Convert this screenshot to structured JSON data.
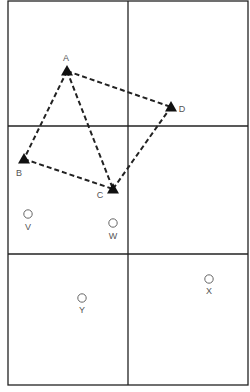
{
  "diagram": {
    "type": "grid-plot-map",
    "grid": {
      "left": 8,
      "top": 1,
      "right": 248,
      "bottom": 385,
      "vertical_dividers": [
        128
      ],
      "horizontal_dividers": [
        126,
        254
      ],
      "cells": 6,
      "line_color": "#222222"
    },
    "triangles": [
      {
        "id": "A",
        "label": "A",
        "x": 67,
        "y": 71,
        "label_x": 66,
        "label_y": 61
      },
      {
        "id": "B",
        "label": "B",
        "x": 24,
        "y": 159,
        "label_x": 19,
        "label_y": 176
      },
      {
        "id": "C",
        "label": "C",
        "x": 113,
        "y": 189,
        "label_x": 100,
        "label_y": 198
      },
      {
        "id": "D",
        "label": "D",
        "x": 171,
        "y": 107,
        "label_x": 182,
        "label_y": 112
      }
    ],
    "circles": [
      {
        "id": "V",
        "label": "V",
        "x": 28,
        "y": 214,
        "label_x": 28,
        "label_y": 230
      },
      {
        "id": "W",
        "label": "W",
        "x": 113,
        "y": 223,
        "label_x": 113,
        "label_y": 239
      },
      {
        "id": "X",
        "label": "X",
        "x": 209,
        "y": 279,
        "label_x": 209,
        "label_y": 294
      },
      {
        "id": "Y",
        "label": "Y",
        "x": 82,
        "y": 298,
        "label_x": 82,
        "label_y": 313
      }
    ],
    "dashed_edges": [
      [
        "A",
        "D"
      ],
      [
        "A",
        "B"
      ],
      [
        "A",
        "C"
      ],
      [
        "B",
        "C"
      ],
      [
        "C",
        "D"
      ]
    ],
    "colors": {
      "marker": "#111111",
      "dash": "#222222",
      "circle_stroke": "#666666",
      "label": "#555555"
    }
  }
}
